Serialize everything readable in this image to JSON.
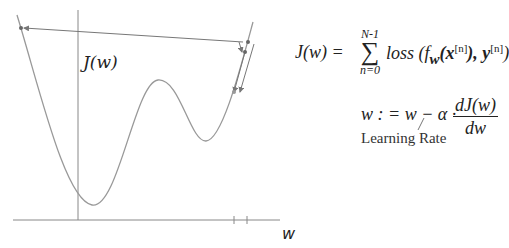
{
  "diagram": {
    "y_axis_label": "J(w)",
    "x_axis_label": "w",
    "colors": {
      "axis": "#777777",
      "curve": "#999999",
      "arrow": "#777777",
      "text": "#222222"
    }
  },
  "formulas": {
    "loss": {
      "lhs": "J(w) =",
      "sum_upper": "N-1",
      "sum_symbol": "∑",
      "sum_lower": "n=0",
      "rhs_prefix": "loss (f",
      "rhs_sub": "w",
      "rhs_x": "(x",
      "rhs_sup1": "[n]",
      "rhs_mid": "), y",
      "rhs_sup2": "[n]",
      "rhs_end": ")"
    },
    "update": {
      "lhs": "w : = w − α ·",
      "numerator": "dJ(w)",
      "denominator": "dw"
    },
    "annotation": "Learning Rate"
  }
}
